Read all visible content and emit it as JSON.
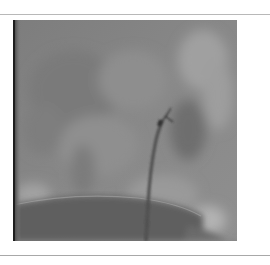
{
  "page": {
    "background": "#ffffff",
    "rule_color": "#b0b0b0"
  },
  "figure": {
    "type": "fluoroscopy-image",
    "tone": "grayscale"
  },
  "caption": {
    "text": "",
    "note": "partially cut off, illegible"
  }
}
